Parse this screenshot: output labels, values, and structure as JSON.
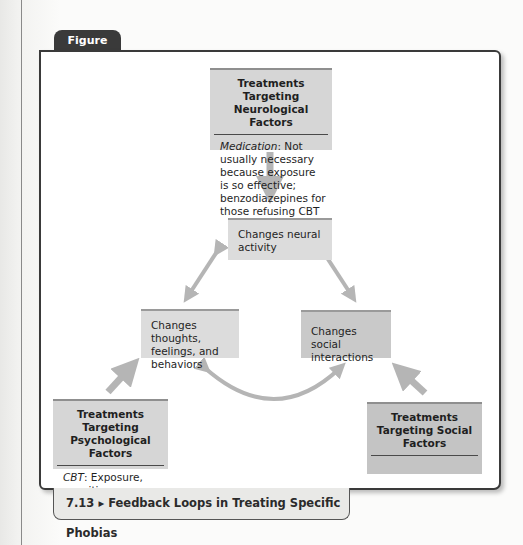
{
  "figure": {
    "tab_label": "Figure 7.13",
    "caption": "7.13 ▸ Feedback Loops in Treating Specific Phobias"
  },
  "treatments": {
    "neurological": {
      "title": "Treatments Targeting Neurological Factors",
      "body_label": "Medication",
      "body_text": ": Not usually necessary because exposure is so effective; benzodiazepines for those refusing CBT"
    },
    "psychological": {
      "title": "Treatments Targeting Psychological Factors",
      "body_label": "CBT",
      "body_text": ": Exposure, cognitive restructuring"
    },
    "social": {
      "title": "Treatments Targeting Social Factors",
      "body_label": "",
      "body_text": ""
    }
  },
  "nodes": {
    "neural": "Changes neural activity",
    "thoughts": "Changes thoughts, feelings, and behaviors",
    "social": "Changes social interactions"
  },
  "colors": {
    "arrow": "#b5b5b5",
    "box_light": "#d6d6d6",
    "box_mid": "#c4c4c4",
    "tab": "#3a3a3a"
  }
}
